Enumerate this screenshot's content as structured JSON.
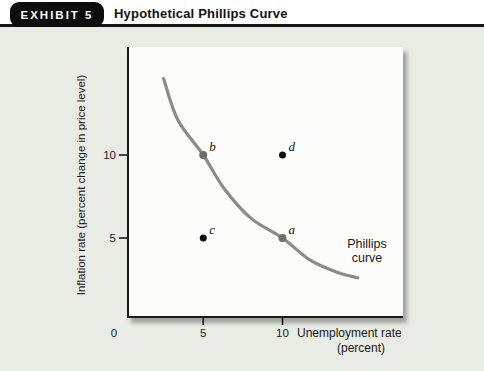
{
  "header": {
    "badge": "EXHIBIT 5",
    "title": "Hypothetical Phillips Curve"
  },
  "chart_data": {
    "type": "line",
    "title": "Hypothetical Phillips Curve",
    "xlabel": "Unemployment rate",
    "xlabel_units": "(percent)",
    "ylabel": "Inflation rate (percent change in price level)",
    "xlim": [
      0,
      17.5
    ],
    "ylim": [
      0,
      16.5
    ],
    "x_ticks": [
      0,
      5,
      10
    ],
    "y_ticks": [
      5,
      10
    ],
    "origin_label": "0",
    "grid": false,
    "legend_position": "none",
    "curve_label": "Phillips\ncurve",
    "series": [
      {
        "name": "Phillips curve",
        "points": [
          [
            2.5,
            14.6
          ],
          [
            3.4,
            12.1
          ],
          [
            5,
            10
          ],
          [
            6.3,
            8.0
          ],
          [
            8.0,
            6.2
          ],
          [
            10,
            5
          ],
          [
            11.7,
            3.7
          ],
          [
            13.4,
            2.95
          ],
          [
            14.75,
            2.6
          ]
        ]
      }
    ],
    "markers": [
      {
        "label": "a",
        "x": 10,
        "y": 5,
        "on_curve": true
      },
      {
        "label": "b",
        "x": 5,
        "y": 10,
        "on_curve": true
      },
      {
        "label": "c",
        "x": 5,
        "y": 5,
        "on_curve": false
      },
      {
        "label": "d",
        "x": 10,
        "y": 10,
        "on_curve": false
      }
    ]
  },
  "colors": {
    "panel_bg": "#e9ebe5",
    "plot_bg": "#fcfcfa",
    "axis": "#1a1a1a",
    "curve": "#8b8b8b",
    "marker_on_curve": "#6e6e6e",
    "marker_off_curve": "#0f0f0f",
    "badge_bg": "#0d0d0d",
    "badge_text": "#ffffff"
  }
}
